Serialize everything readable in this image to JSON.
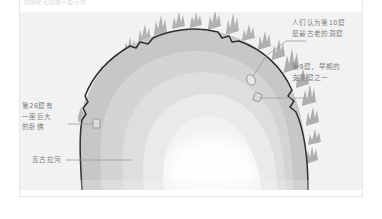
{
  "page": {
    "top_caption": "阿旃陀石窟群平面示意",
    "background_color": "#ffffff",
    "panel_color": "#f2f2f2"
  },
  "diagram": {
    "type": "plan-map",
    "palette": {
      "outer_slope": "#c9c9c9",
      "mid_slope": "#d6d6d6",
      "inner_slope": "#e0e0e0",
      "terrace": "#ececec",
      "core": "#ffffff",
      "cliff_outline": "#2b2b2b",
      "tree": "#b4b4b4",
      "tree_dark": "#a3a3a3",
      "leader_line": "#9a9a9a",
      "text": "#7f7f7f"
    },
    "features": {
      "gorge_shape": "horseshoe",
      "contour_band_count": 5,
      "river_label_position": "bottom-left",
      "tree_clusters": "ridge-top"
    }
  },
  "annotations": [
    {
      "id": "cave-10",
      "text": "人们认为第10窟\n是最古老的洞窟",
      "position": "top-right",
      "leader": true
    },
    {
      "id": "cave-9",
      "text": "第9窟，早期的\n支提窟之一",
      "position": "right",
      "leader": true
    },
    {
      "id": "cave-26",
      "text": "第26窟有\n一座巨大\n的卧佛",
      "position": "left",
      "leader": true
    },
    {
      "id": "waghora-river",
      "text": "瓦古拉河",
      "position": "bottom-left",
      "leader": true
    }
  ]
}
